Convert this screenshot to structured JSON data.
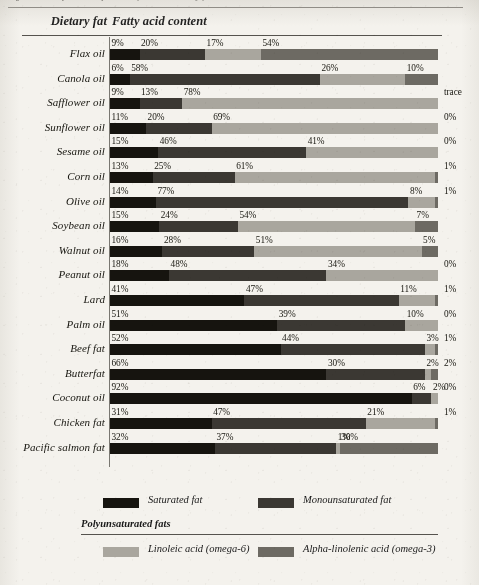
{
  "page": {
    "cropped_caption": "Figure 5.1 Fatty acid composition of common dietary fats"
  },
  "header": {
    "col_dietary_fat": "Dietary fat",
    "col_fatty_acid": "Fatty acid content"
  },
  "legend": {
    "saturated": "Saturated fat",
    "monounsaturated": "Monounsaturated fat",
    "polyunsaturated_heading": "Polyunsaturated fats",
    "linoleic": "Linoleic acid (omega-6)",
    "alpha_linolenic": "Alpha-linolenic acid (omega-3)"
  },
  "colors": {
    "saturated": "#16140f",
    "monounsaturated": "#3b3833",
    "linoleic": "#a9a69e",
    "alpha_linolenic": "#6d6a63",
    "paper": "#f4f2ed",
    "rule": "#55534e"
  },
  "chart_data": {
    "type": "bar",
    "subtype": "stacked-horizontal-100pct",
    "title": "Fatty acid content",
    "xlabel": "",
    "ylabel": "Dietary fat",
    "xlim": [
      0,
      100
    ],
    "grid": false,
    "legend_position": "bottom",
    "categories": [
      "Flax oil",
      "Canola oil",
      "Safflower oil",
      "Sunflower oil",
      "Sesame oil",
      "Corn oil",
      "Olive oil",
      "Soybean oil",
      "Walnut oil",
      "Peanut oil",
      "Lard",
      "Palm oil",
      "Beef fat",
      "Butterfat",
      "Coconut oil",
      "Chicken fat",
      "Pacific salmon fat"
    ],
    "series": [
      {
        "name": "Saturated fat",
        "values": [
          9,
          6,
          9,
          11,
          15,
          13,
          14,
          15,
          16,
          18,
          41,
          51,
          52,
          66,
          92,
          31,
          32
        ]
      },
      {
        "name": "Monounsaturated fat",
        "values": [
          20,
          58,
          13,
          20,
          46,
          25,
          77,
          24,
          28,
          48,
          47,
          39,
          44,
          30,
          6,
          47,
          37
        ]
      },
      {
        "name": "Linoleic acid (omega-6)",
        "values": [
          17,
          26,
          78,
          69,
          41,
          61,
          8,
          54,
          51,
          34,
          11,
          10,
          3,
          2,
          2,
          21,
          1
        ]
      },
      {
        "name": "Alpha-linolenic acid (omega-3)",
        "values": [
          54,
          10,
          0,
          0,
          0,
          1,
          1,
          7,
          5,
          0,
          1,
          0,
          1,
          2,
          0,
          1,
          30
        ]
      }
    ],
    "rows": [
      {
        "name": "Flax oil",
        "labels": [
          "9%",
          "20%",
          "17%",
          "54%"
        ],
        "values": [
          9,
          20,
          17,
          54
        ],
        "last_outside": false
      },
      {
        "name": "Canola oil",
        "labels": [
          "6%",
          "58%",
          "26%",
          "10%"
        ],
        "values": [
          6,
          58,
          26,
          10
        ],
        "last_outside": false
      },
      {
        "name": "Safflower oil",
        "labels": [
          "9%",
          "13%",
          "78%",
          "trace"
        ],
        "values": [
          9,
          13,
          78,
          0
        ],
        "last_outside": true
      },
      {
        "name": "Sunflower oil",
        "labels": [
          "11%",
          "20%",
          "69%",
          "0%"
        ],
        "values": [
          11,
          20,
          69,
          0
        ],
        "last_outside": true
      },
      {
        "name": "Sesame oil",
        "labels": [
          "15%",
          "46%",
          "41%",
          "0%"
        ],
        "values": [
          15,
          46,
          41,
          0
        ],
        "last_outside": true
      },
      {
        "name": "Corn oil",
        "labels": [
          "13%",
          "25%",
          "61%",
          "1%"
        ],
        "values": [
          13,
          25,
          61,
          1
        ],
        "last_outside": true
      },
      {
        "name": "Olive oil",
        "labels": [
          "14%",
          "77%",
          "8%",
          "1%"
        ],
        "values": [
          14,
          77,
          8,
          1
        ],
        "last_outside": true
      },
      {
        "name": "Soybean oil",
        "labels": [
          "15%",
          "24%",
          "54%",
          "7%"
        ],
        "values": [
          15,
          24,
          54,
          7
        ],
        "last_outside": false
      },
      {
        "name": "Walnut oil",
        "labels": [
          "16%",
          "28%",
          "51%",
          "5%"
        ],
        "values": [
          16,
          28,
          51,
          5
        ],
        "last_outside": false
      },
      {
        "name": "Peanut oil",
        "labels": [
          "18%",
          "48%",
          "34%",
          "0%"
        ],
        "values": [
          18,
          48,
          34,
          0
        ],
        "last_outside": true
      },
      {
        "name": "Lard",
        "labels": [
          "41%",
          "47%",
          "11%",
          "1%"
        ],
        "values": [
          41,
          47,
          11,
          1
        ],
        "last_outside": true
      },
      {
        "name": "Palm oil",
        "labels": [
          "51%",
          "39%",
          "10%",
          "0%"
        ],
        "values": [
          51,
          39,
          10,
          0
        ],
        "last_outside": true
      },
      {
        "name": "Beef fat",
        "labels": [
          "52%",
          "44%",
          "3%",
          "1%"
        ],
        "values": [
          52,
          44,
          3,
          1
        ],
        "last_outside": true
      },
      {
        "name": "Butterfat",
        "labels": [
          "66%",
          "30%",
          "2%",
          "2%"
        ],
        "values": [
          66,
          30,
          2,
          2
        ],
        "last_outside": true
      },
      {
        "name": "Coconut oil",
        "labels": [
          "92%",
          "6%",
          "2%",
          "0%"
        ],
        "values": [
          92,
          6,
          2,
          0
        ],
        "last_outside": true
      },
      {
        "name": "Chicken fat",
        "labels": [
          "31%",
          "47%",
          "21%",
          "1%"
        ],
        "values": [
          31,
          47,
          21,
          1
        ],
        "last_outside": true
      },
      {
        "name": "Pacific salmon fat",
        "labels": [
          "32%",
          "37%",
          "1%",
          "30%"
        ],
        "values": [
          32,
          37,
          1,
          30
        ],
        "last_outside": false
      }
    ]
  }
}
